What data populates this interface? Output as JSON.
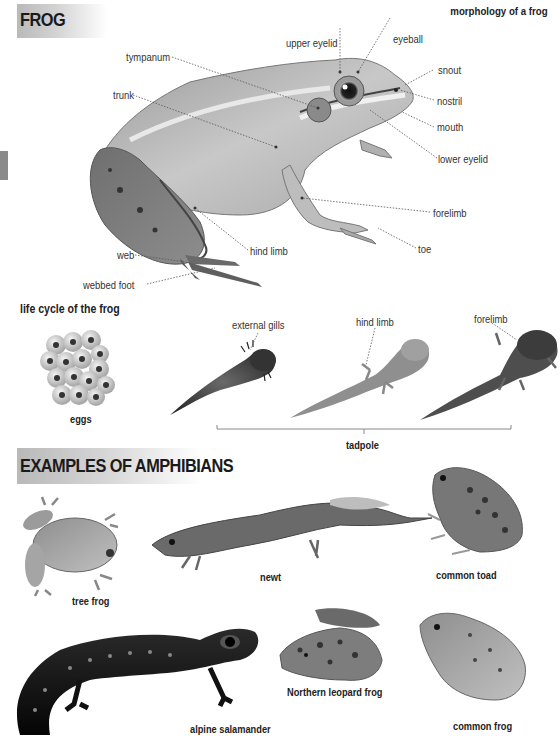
{
  "header": {
    "title": "FROG",
    "subtitle": "morphology of a frog"
  },
  "morphology": {
    "labels": {
      "tympanum": "tympanum",
      "upper_eyelid": "upper eyelid",
      "eyeball": "eyeball",
      "snout": "snout",
      "trunk": "trunk",
      "nostril": "nostril",
      "mouth": "mouth",
      "lower_eyelid": "lower eyelid",
      "forelimb": "forelimb",
      "toe": "toe",
      "hind_limb": "hind limb",
      "web": "web",
      "webbed_foot": "webbed foot"
    }
  },
  "life_cycle": {
    "title": "life cycle of the frog",
    "eggs_caption": "eggs",
    "tadpole_caption": "tadpole",
    "stage_labels": [
      "external gills",
      "hind limb",
      "forelimb"
    ]
  },
  "examples": {
    "title": "EXAMPLES OF AMPHIBIANS",
    "items": [
      {
        "name": "tree frog"
      },
      {
        "name": "newt"
      },
      {
        "name": "common toad"
      },
      {
        "name": "alpine salamander"
      },
      {
        "name": "Northern leopard frog"
      },
      {
        "name": "common frog"
      }
    ]
  },
  "colors": {
    "header_gradient_start": "#b9b9b9",
    "header_gradient_end": "#ffffff",
    "text": "#222222",
    "leader_line": "#555555",
    "edge_tab": "#8a8a8a"
  }
}
